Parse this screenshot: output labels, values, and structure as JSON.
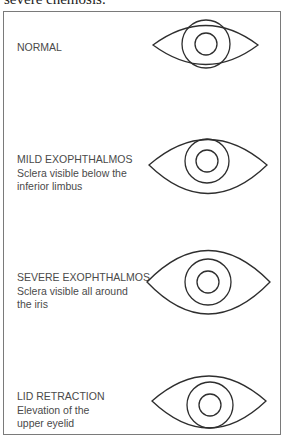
{
  "caption_top": "severe chemosis.",
  "panels": [
    {
      "id": "normal",
      "title": "NORMAL",
      "lines": []
    },
    {
      "id": "mild-exophthalmos",
      "title": "MILD EXOPHTHALMOS",
      "lines": [
        "Sclera visible below the",
        "inferior limbus"
      ]
    },
    {
      "id": "severe-exophthalmos",
      "title": "SEVERE EXOPHTHALMOS",
      "lines": [
        "Sclera visible all around",
        "the iris"
      ]
    },
    {
      "id": "lid-retraction",
      "title": "LID RETRACTION",
      "lines": [
        "Elevation of the",
        "upper eyelid"
      ]
    }
  ],
  "colors": {
    "frame": "#7a7a7a",
    "text": "#4a4a4a",
    "line": "#2e2e2e"
  }
}
